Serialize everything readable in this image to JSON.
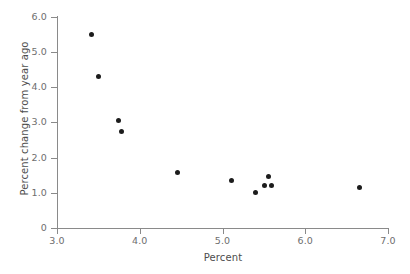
{
  "chart_data": {
    "type": "scatter",
    "title": "",
    "subtitle": "",
    "xlabel": "Percent",
    "ylabel": "Percent change from year ago",
    "xlim": [
      3.0,
      7.0
    ],
    "ylim": [
      0,
      6.0
    ],
    "xticks": [
      "3.0",
      "4.0",
      "5.0",
      "6.0",
      "7.0"
    ],
    "xtick_values": [
      3.0,
      4.0,
      5.0,
      6.0,
      7.0
    ],
    "yticks": [
      "0",
      "1.0",
      "2.0",
      "3.0",
      "4.0",
      "5.0",
      "6.0"
    ],
    "ytick_values": [
      0,
      1.0,
      2.0,
      3.0,
      4.0,
      5.0,
      6.0
    ],
    "grid": false,
    "legend": null,
    "legend_position": "none",
    "annotations": [],
    "series": [
      {
        "name": "observations",
        "marker": "circle",
        "marker_color": "#1c1c1c",
        "points": [
          {
            "x": 3.42,
            "y": 5.49
          },
          {
            "x": 3.5,
            "y": 4.29
          },
          {
            "x": 3.74,
            "y": 3.06
          },
          {
            "x": 3.78,
            "y": 2.74
          },
          {
            "x": 4.46,
            "y": 1.57
          },
          {
            "x": 5.11,
            "y": 1.34
          },
          {
            "x": 5.4,
            "y": 1.0
          },
          {
            "x": 5.51,
            "y": 1.2
          },
          {
            "x": 5.55,
            "y": 1.46
          },
          {
            "x": 5.59,
            "y": 1.2
          },
          {
            "x": 6.66,
            "y": 1.14
          }
        ]
      }
    ]
  },
  "style": {
    "axis_color": "#8a8a8a",
    "tick_label_color": "#6e6e6e",
    "axis_title_color": "#4d4d4d",
    "marker_color": "#1c1c1c",
    "background": "#ffffff"
  }
}
